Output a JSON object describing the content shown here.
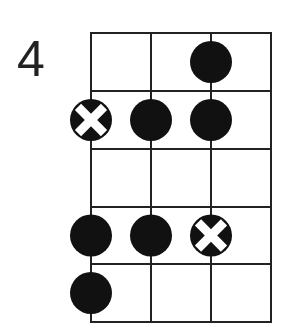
{
  "diagram": {
    "type": "fretboard-scale-pattern",
    "start_fret_label": "4",
    "strings": 4,
    "frets": 5,
    "grid": {
      "x_lines": [
        91,
        151,
        211,
        271
      ],
      "y_lines": [
        33,
        91,
        149,
        207,
        264,
        322
      ],
      "line_color": "#222222",
      "line_width": 2
    },
    "dot_radius": 21,
    "dot_color": "#111111",
    "x_mark_color": "#ffffff",
    "markers": [
      {
        "fret": 1,
        "string": 3,
        "kind": "dot"
      },
      {
        "fret": 2,
        "string": 1,
        "kind": "root-x"
      },
      {
        "fret": 2,
        "string": 2,
        "kind": "dot"
      },
      {
        "fret": 2,
        "string": 3,
        "kind": "dot"
      },
      {
        "fret": 4,
        "string": 1,
        "kind": "dot"
      },
      {
        "fret": 4,
        "string": 2,
        "kind": "dot"
      },
      {
        "fret": 4,
        "string": 3,
        "kind": "root-x"
      },
      {
        "fret": 5,
        "string": 1,
        "kind": "dot"
      }
    ]
  }
}
